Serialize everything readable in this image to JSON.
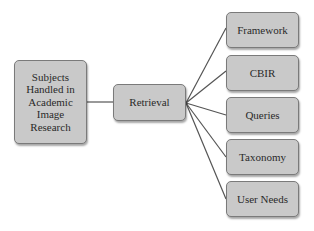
{
  "diagram": {
    "type": "tree",
    "root": {
      "label": "Subjects Handled in Academic Image Research",
      "lines": [
        "Subjects",
        "Handled in",
        "Academic",
        "Image",
        "Research"
      ]
    },
    "branch": {
      "label": "Retrieval"
    },
    "leaves": [
      {
        "label": "Framework"
      },
      {
        "label": "CBIR"
      },
      {
        "label": "Queries"
      },
      {
        "label": "Taxonomy"
      },
      {
        "label": "User Needs"
      }
    ],
    "edges": [
      {
        "from": "Subjects Handled in Academic Image Research",
        "to": "Retrieval"
      },
      {
        "from": "Retrieval",
        "to": "Framework"
      },
      {
        "from": "Retrieval",
        "to": "CBIR"
      },
      {
        "from": "Retrieval",
        "to": "Queries"
      },
      {
        "from": "Retrieval",
        "to": "Taxonomy"
      },
      {
        "from": "Retrieval",
        "to": "User Needs"
      }
    ],
    "colors": {
      "node_fill": "#c9c9c9",
      "node_border": "#7a7a7a",
      "line": "#555555",
      "text": "#2a2a2a"
    }
  }
}
